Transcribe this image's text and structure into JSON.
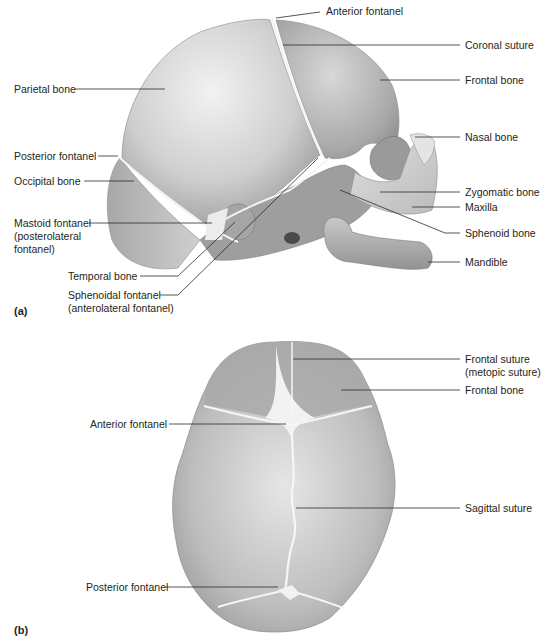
{
  "figure": {
    "panel_a": {
      "tag": "(a)",
      "view": "lateral view of fetal skull",
      "labels": {
        "anterior_fontanel": "Anterior fontanel",
        "coronal_suture": "Coronal suture",
        "frontal_bone": "Frontal bone",
        "parietal_bone": "Parietal bone",
        "nasal_bone": "Nasal bone",
        "posterior_fontanel": "Posterior fontanel",
        "occipital_bone": "Occipital bone",
        "zygomatic_bone": "Zygomatic bone",
        "maxilla": "Maxilla",
        "mastoid_fontanel_1": "Mastoid fontanel",
        "mastoid_fontanel_2": "(posterolateral",
        "mastoid_fontanel_3": "fontanel)",
        "sphenoid_bone": "Sphenoid bone",
        "mandible": "Mandible",
        "temporal_bone": "Temporal bone",
        "sphenoidal_fontanel_1": "Sphenoidal fontanel",
        "sphenoidal_fontanel_2": "(anterolateral fontanel)"
      }
    },
    "panel_b": {
      "tag": "(b)",
      "view": "superior view of fetal skull",
      "labels": {
        "frontal_suture_1": "Frontal suture",
        "frontal_suture_2": "(metopic suture)",
        "frontal_bone": "Frontal bone",
        "anterior_fontanel": "Anterior fontanel",
        "sagittal_suture": "Sagittal suture",
        "posterior_fontanel": "Posterior fontanel"
      }
    },
    "colors": {
      "bone_light": "#e2e2e2",
      "bone_mid": "#bdbdbd",
      "bone_dark": "#8f8f8f",
      "suture": "#f4f4f4",
      "leader_line": "#2b2b2b"
    }
  }
}
